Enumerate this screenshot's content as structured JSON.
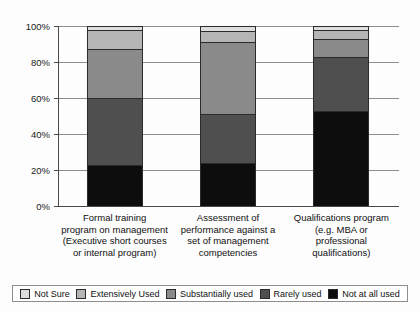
{
  "chart_data": {
    "type": "bar",
    "subtype": "stacked-bar-100-percent",
    "title": "",
    "xlabel": "",
    "ylabel": "",
    "ylim": [
      0,
      100
    ],
    "ytick_labels": [
      "0%",
      "20%",
      "40%",
      "60%",
      "80%",
      "100%"
    ],
    "ytick_values": [
      0,
      20,
      40,
      60,
      80,
      100
    ],
    "grid": true,
    "legend_position": "bottom",
    "categories": [
      "Formal training program on management (Executive short courses or internal program)",
      "Assessment of performance against a set of management competencies",
      "Qualifications program (e.g. MBA or professional qualifications)"
    ],
    "category_lines": [
      [
        "Formal training",
        "program on management",
        "(Executive short courses",
        "or internal program)"
      ],
      [
        "Assessment of",
        "performance against a",
        "set of management",
        "competencies"
      ],
      [
        "Qualifications program",
        "(e.g. MBA or",
        "professional",
        "qualifications)"
      ]
    ],
    "series": [
      {
        "name": "Not at all used",
        "color": "#0d0d0d",
        "values": [
          23,
          24,
          53
        ]
      },
      {
        "name": "Rarely used",
        "color": "#4f4f4f",
        "values": [
          37,
          27,
          30
        ]
      },
      {
        "name": "Substantially used",
        "color": "#8a8a8a",
        "values": [
          27,
          40,
          10
        ]
      },
      {
        "name": "Extensively Used",
        "color": "#b5b5b5",
        "values": [
          11,
          6,
          5
        ]
      },
      {
        "name": "Not Sure",
        "color": "#dedede",
        "values": [
          2,
          3,
          2
        ]
      }
    ]
  },
  "legend": {
    "items": [
      {
        "label": "Not Sure",
        "color": "#dedede"
      },
      {
        "label": "Extensively Used",
        "color": "#b5b5b5"
      },
      {
        "label": "Substantially used",
        "color": "#8a8a8a"
      },
      {
        "label": "Rarely used",
        "color": "#4f4f4f"
      },
      {
        "label": "Not at all used",
        "color": "#0d0d0d"
      }
    ]
  }
}
